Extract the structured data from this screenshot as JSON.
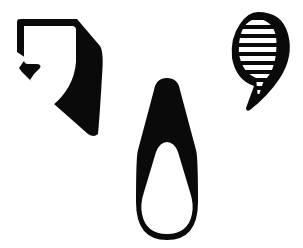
{
  "canvas": {
    "width": 303,
    "height": 248,
    "background": "#ffffff"
  },
  "colors": {
    "ink": "#0a0a0a",
    "paper": "#ffffff"
  },
  "figures": [
    {
      "id": "shield",
      "icon": "shield-comma-icon",
      "description": "Black shield-like outline with white comma-shaped interior and heavy right shadow"
    },
    {
      "id": "drop",
      "icon": "teardrop-icon",
      "description": "Inverted teardrop: black pointed top with white rounded loop at bottom"
    },
    {
      "id": "comma",
      "icon": "striped-comma-icon",
      "description": "Black comma shape with horizontal white stripes inside the head"
    }
  ]
}
